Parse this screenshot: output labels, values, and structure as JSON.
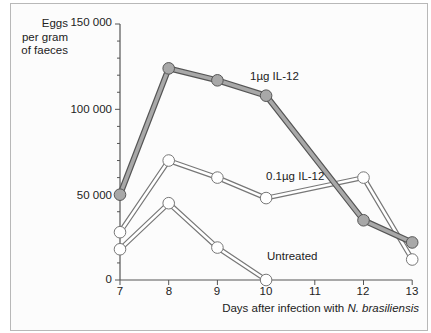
{
  "chart_data": {
    "type": "line",
    "title": "",
    "xlabel": "Days after infection with N. brasiliensis",
    "xlabel_parts": {
      "prefix": "Days after infection with ",
      "italic": "N. brasiliensis"
    },
    "ylabel": "Eggs per gram of faeces",
    "ylabel_lines": [
      "Eggs",
      "per gram",
      "of faeces"
    ],
    "xlim": [
      7,
      13
    ],
    "ylim": [
      0,
      150000
    ],
    "x_ticks": [
      "7",
      "8",
      "9",
      "10",
      "11",
      "12",
      "13"
    ],
    "y_ticks": [
      {
        "value": 0,
        "label": "0"
      },
      {
        "value": 50000,
        "label": "50 000"
      },
      {
        "value": 100000,
        "label": "100 000"
      },
      {
        "value": 150000,
        "label": "150 000"
      }
    ],
    "grid": false,
    "legend": "inline labels",
    "series": [
      {
        "name": "1µg IL-12",
        "x": [
          7,
          8,
          9,
          10,
          12,
          13
        ],
        "values": [
          50000,
          124000,
          117000,
          108000,
          35000,
          22000
        ],
        "marker_fill": "#a8a8a8",
        "line_fill": "#a8a8a8",
        "outline": "#555555"
      },
      {
        "name": "0.1µg IL-12",
        "x": [
          7,
          8,
          9,
          10,
          12,
          13
        ],
        "values": [
          28000,
          70000,
          60000,
          48000,
          60000,
          12000
        ],
        "marker_fill": "#ffffff",
        "line_fill": "#ffffff",
        "outline": "#777777"
      },
      {
        "name": "Untreated",
        "x": [
          7,
          8,
          9,
          10
        ],
        "values": [
          18000,
          45000,
          19000,
          0
        ],
        "marker_fill": "#ffffff",
        "line_fill": "#ffffff",
        "outline": "#777777"
      }
    ]
  },
  "labels": {
    "series_1": "1µg IL-12",
    "series_2": "0.1µg IL-12",
    "series_3": "Untreated"
  }
}
